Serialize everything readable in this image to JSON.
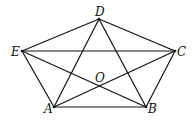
{
  "figure": {
    "type": "pentagon with all diagonals",
    "points": {
      "A": {
        "label": "A",
        "x": 54,
        "y": 107
      },
      "B": {
        "label": "B",
        "x": 146,
        "y": 107
      },
      "C": {
        "label": "C",
        "x": 175,
        "y": 51
      },
      "D": {
        "label": "D",
        "x": 99,
        "y": 19
      },
      "E": {
        "label": "E",
        "x": 22,
        "y": 51
      },
      "O": {
        "label": "O",
        "x": 100,
        "y": 86
      }
    },
    "sides": [
      "AB",
      "BC",
      "CD",
      "DE",
      "EA"
    ],
    "diagonals": [
      "AC",
      "AD",
      "BD",
      "BE",
      "CE"
    ],
    "intersection_note": "O is the intersection of AC and BE"
  }
}
